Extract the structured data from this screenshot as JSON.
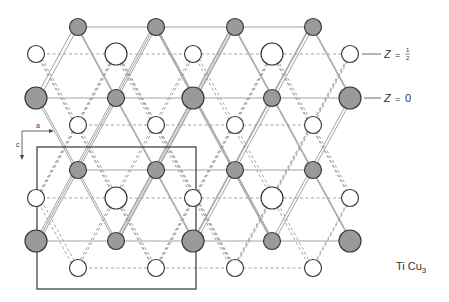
{
  "figure": {
    "compound": "TiCu3",
    "compound_parts": {
      "el1": "Ti",
      "el2": "Cu",
      "sub": "3"
    },
    "layer_labels": [
      {
        "text": "Z = ",
        "frac_num": "1",
        "frac_den": "2",
        "y": 54
      },
      {
        "text": "Z = 0",
        "y": 98
      }
    ],
    "axes": {
      "a": "a",
      "c": "c"
    },
    "colors": {
      "gray_atom": "#9a9a9a",
      "white_atom": "#ffffff",
      "stroke": "#3a3a3a",
      "line": "#9a9a9a"
    },
    "unit_cell": {
      "x1": 37,
      "y1": 147,
      "x2": 196,
      "y2": 289
    },
    "atoms": {
      "z0_rows": [
        {
          "y": 27,
          "atoms": [
            [
              78,
              "s"
            ],
            [
              156,
              "s"
            ],
            [
              235,
              "s"
            ],
            [
              313,
              "s"
            ]
          ]
        },
        {
          "y": 98,
          "atoms": [
            [
              36,
              "L"
            ],
            [
              116,
              "s"
            ],
            [
              193,
              "L"
            ],
            [
              272,
              "s"
            ],
            [
              350,
              "L"
            ]
          ]
        },
        {
          "y": 170,
          "atoms": [
            [
              78,
              "s"
            ],
            [
              156,
              "s"
            ],
            [
              235,
              "s"
            ],
            [
              313,
              "s"
            ]
          ]
        },
        {
          "y": 241,
          "atoms": [
            [
              36,
              "L"
            ],
            [
              116,
              "s"
            ],
            [
              193,
              "L"
            ],
            [
              272,
              "s"
            ],
            [
              350,
              "L"
            ]
          ]
        }
      ],
      "zhalf_rows": [
        {
          "y": 54,
          "atoms": [
            [
              36,
              "s"
            ],
            [
              116,
              "L"
            ],
            [
              193,
              "s"
            ],
            [
              272,
              "L"
            ],
            [
              350,
              "s"
            ]
          ]
        },
        {
          "y": 125,
          "atoms": [
            [
              78,
              "s"
            ],
            [
              156,
              "s"
            ],
            [
              235,
              "s"
            ],
            [
              313,
              "s"
            ]
          ]
        },
        {
          "y": 198,
          "atoms": [
            [
              36,
              "s"
            ],
            [
              116,
              "L"
            ],
            [
              193,
              "s"
            ],
            [
              272,
              "L"
            ],
            [
              350,
              "s"
            ]
          ]
        },
        {
          "y": 268,
          "atoms": [
            [
              78,
              "s"
            ],
            [
              156,
              "s"
            ],
            [
              235,
              "s"
            ],
            [
              313,
              "s"
            ]
          ]
        }
      ]
    }
  }
}
